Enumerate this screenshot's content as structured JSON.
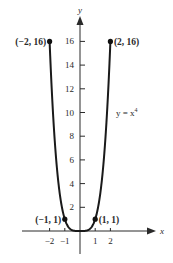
{
  "chart_data": {
    "type": "line",
    "title": "",
    "function_label": "y = x⁴",
    "xlabel": "x",
    "ylabel": "y",
    "xlim": [
      -3.5,
      5
    ],
    "ylim": [
      -2.5,
      19
    ],
    "grid": false,
    "legend": null,
    "x_ticks": [
      -2,
      -1,
      1,
      2
    ],
    "x_tick_labels": [
      "−2",
      "−1",
      "1",
      "2"
    ],
    "y_ticks": [
      2,
      4,
      6,
      8,
      10,
      12,
      14,
      16
    ],
    "y_tick_labels": [
      "2",
      "4",
      "6",
      "8",
      "10",
      "12",
      "14",
      "16"
    ],
    "series": [
      {
        "name": "y = x^4",
        "domain": [
          -2,
          2
        ],
        "x": [
          -2,
          -1.75,
          -1.5,
          -1.25,
          -1,
          -0.75,
          -0.5,
          -0.25,
          0,
          0.25,
          0.5,
          0.75,
          1,
          1.25,
          1.5,
          1.75,
          2
        ],
        "values": [
          16,
          9.38,
          5.06,
          2.44,
          1,
          0.32,
          0.06,
          0.004,
          0,
          0.004,
          0.06,
          0.32,
          1,
          2.44,
          5.06,
          9.38,
          16
        ]
      }
    ],
    "points": [
      {
        "x": -2,
        "y": 16,
        "label": "(−2, 16)"
      },
      {
        "x": 2,
        "y": 16,
        "label": "(2, 16)"
      },
      {
        "x": -1,
        "y": 1,
        "label": "(−1, 1)"
      },
      {
        "x": 1,
        "y": 1,
        "label": "(1, 1)"
      }
    ]
  }
}
